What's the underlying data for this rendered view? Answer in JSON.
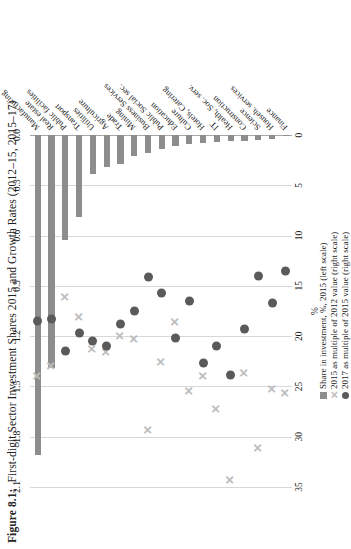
{
  "figure": {
    "label": "Figure 8.1:",
    "title": "First-digit Sector Investment Shares 2015 and Growth Rates (2012–15, 2015–17)"
  },
  "legend": {
    "items": [
      {
        "icon": "bar-swatch",
        "label": "Share in investment, %, 2015 (left scale)"
      },
      {
        "icon": "cross-marker",
        "label": "2015 as multiple of 2012 value (right scale)"
      },
      {
        "icon": "dot-marker",
        "label": "2017 as multiple of 2015 value (right scale)"
      }
    ]
  },
  "colors": {
    "bar": "#8d8d8d",
    "dot": "#5a5a5a",
    "cross": "#bdbdbd",
    "grid": "#d8d8d8",
    "axis": "#a8a8a8"
  },
  "chart_data": {
    "type": "bar",
    "title": "First-digit Sector Investment Shares 2015 and Growth Rates (2012–15, 2015–17)",
    "orientation": "horizontal",
    "grid": true,
    "legend_position": "bottom",
    "xlabel": "%",
    "ylabel": "",
    "xlim": [
      0,
      35
    ],
    "xticks": [
      "0",
      "5",
      "10",
      "15",
      "20",
      "25",
      "30",
      "35"
    ],
    "secondary_axis": {
      "position": "top",
      "lim": [
        0.0,
        2.1
      ],
      "ticks": [
        "0.0",
        "0.3",
        "0.6",
        "0.9",
        "1.2",
        "1.5",
        "1.8",
        "2.1"
      ]
    },
    "categories": [
      "Manufacturing",
      "Real estate",
      "Public facilities",
      "Transport",
      "Utilities",
      "Agriculture",
      "Trade",
      "Mining",
      "Business Services",
      "Public Social sec.",
      "Education",
      "Culture",
      "Hotels, Catering",
      "IT",
      "Health, Soc. serv.",
      "Construction",
      "Science",
      "Househ. services",
      "Finance"
    ],
    "series": [
      {
        "name": "Share in investment, %, 2015 (left scale)",
        "axis": "left",
        "mark": "bar",
        "values": [
          31.8,
          23.2,
          10.4,
          8.2,
          3.9,
          3.2,
          2.9,
          2.1,
          1.8,
          1.4,
          1.1,
          0.9,
          0.8,
          0.7,
          0.6,
          0.55,
          0.5,
          0.4,
          0.15
        ]
      },
      {
        "name": "2015 as multiple of 2012 value (right scale)",
        "axis": "right",
        "mark": "cross",
        "values": [
          1.44,
          1.38,
          0.97,
          1.09,
          1.28,
          1.3,
          1.2,
          1.22,
          1.76,
          1.36,
          1.12,
          1.53,
          1.44,
          1.64,
          2.06,
          1.42,
          1.87,
          1.52,
          1.54
        ]
      },
      {
        "name": "2017 as multiple of 2015 value (right scale)",
        "axis": "right",
        "mark": "dot",
        "values": [
          1.11,
          1.1,
          1.29,
          1.18,
          1.23,
          1.26,
          1.13,
          1.05,
          0.85,
          0.94,
          1.21,
          0.99,
          1.36,
          1.26,
          1.43,
          1.16,
          0.84,
          1.0,
          0.81
        ]
      }
    ]
  }
}
